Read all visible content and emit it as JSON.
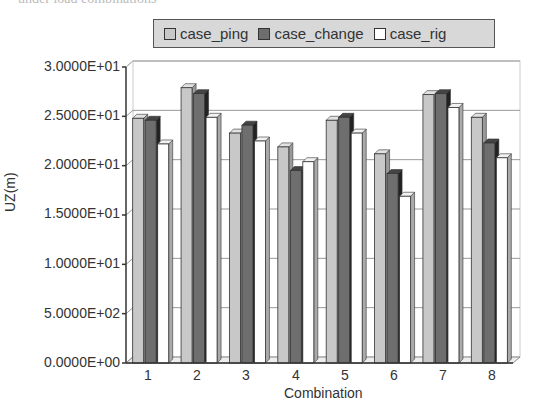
{
  "caption_fragment": "under load combinations",
  "chart_data": {
    "type": "bar",
    "style": "3d-clustered",
    "title": "",
    "xlabel": "Combination",
    "ylabel": "UZ(m)",
    "categories": [
      "1",
      "2",
      "3",
      "4",
      "5",
      "6",
      "7",
      "8"
    ],
    "series": [
      {
        "name": "case_ping",
        "color": "#c8c8c8",
        "values": [
          24.8,
          27.9,
          23.3,
          21.9,
          24.6,
          21.2,
          27.2,
          24.9
        ]
      },
      {
        "name": "case_change",
        "color": "#6e6e6e",
        "values": [
          24.6,
          27.3,
          24.1,
          19.5,
          24.9,
          19.2,
          27.3,
          22.3
        ]
      },
      {
        "name": "case_rig",
        "color": "#ffffff",
        "values": [
          22.2,
          24.9,
          22.5,
          20.4,
          23.3,
          16.9,
          25.9,
          20.8
        ]
      }
    ],
    "ylim": [
      0,
      30
    ],
    "yticks": [
      0,
      5,
      10,
      15,
      20,
      25,
      30
    ],
    "ytick_labels": [
      "0.0000E+00",
      "5.0000E+02",
      "1.0000E+01",
      "1.5000E+01",
      "2.0000E+01",
      "2.5000E+01",
      "3.0000E+01"
    ],
    "grid": true,
    "legend_position": "top"
  },
  "legend": {
    "items": [
      {
        "label": "case_ping",
        "color": "#c8c8c8"
      },
      {
        "label": "case_change",
        "color": "#6e6e6e"
      },
      {
        "label": "case_rig",
        "color": "#ffffff"
      }
    ]
  },
  "axes": {
    "x_title": "Combination",
    "y_title": "UZ(m)",
    "x_labels": [
      "1",
      "2",
      "3",
      "4",
      "5",
      "6",
      "7",
      "8"
    ],
    "y_labels": [
      "3.0000E+01",
      "2.5000E+01",
      "2.0000E+01",
      "1.5000E+01",
      "1.0000E+01",
      "5.0000E+02",
      "0.0000E+00"
    ]
  }
}
